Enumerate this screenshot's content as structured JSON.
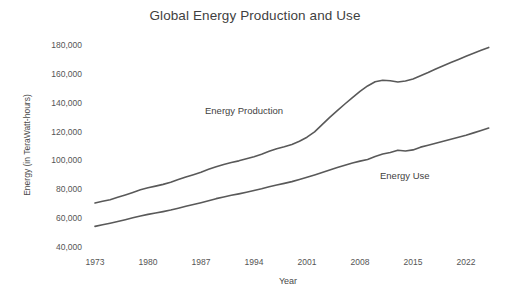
{
  "chart_data": {
    "type": "line",
    "title": "Global Energy Production and Use",
    "xlabel": "Year",
    "ylabel": "Energy (in TeraWatt-hours)",
    "xlim": [
      1973,
      2025
    ],
    "ylim": [
      40000,
      180000
    ],
    "grid": false,
    "legend_position": "inline-labels",
    "y_ticks": [
      40000,
      60000,
      80000,
      100000,
      120000,
      140000,
      160000,
      180000
    ],
    "y_tick_labels": [
      "40,000",
      "60,000",
      "80,000",
      "100,000",
      "120,000",
      "140,000",
      "160,000",
      "180,000"
    ],
    "x_ticks": [
      1973,
      1980,
      1987,
      1994,
      2001,
      2008,
      2015,
      2022
    ],
    "x_tick_labels": [
      "1973",
      "1980",
      "1987",
      "1994",
      "2001",
      "2008",
      "2015",
      "2022"
    ],
    "line_color": "#595959",
    "line_width": 1.6,
    "x": [
      1973,
      1974,
      1975,
      1976,
      1977,
      1978,
      1979,
      1980,
      1981,
      1982,
      1983,
      1984,
      1985,
      1986,
      1987,
      1988,
      1989,
      1990,
      1991,
      1992,
      1993,
      1994,
      1995,
      1996,
      1997,
      1998,
      1999,
      2000,
      2001,
      2002,
      2003,
      2004,
      2005,
      2006,
      2007,
      2008,
      2009,
      2010,
      2011,
      2012,
      2013,
      2014,
      2015,
      2016,
      2017,
      2018,
      2019,
      2020,
      2021,
      2022,
      2023,
      2024,
      2025
    ],
    "series": [
      {
        "name": "Energy Production",
        "label": "Energy Production",
        "color": "#595959",
        "values": [
          71200,
          72400,
          73500,
          75200,
          76800,
          78500,
          80300,
          81700,
          82900,
          84100,
          85600,
          87400,
          89200,
          90800,
          92500,
          94500,
          96300,
          97900,
          99200,
          100400,
          101800,
          103300,
          105000,
          107000,
          108800,
          110200,
          111800,
          114000,
          116800,
          120500,
          125500,
          130500,
          135200,
          139800,
          144200,
          148500,
          152300,
          155200,
          156300,
          155900,
          155000,
          155800,
          157200,
          159400,
          161600,
          164000,
          166300,
          168500,
          170700,
          172900,
          175000,
          177000,
          179000
        ]
      },
      {
        "name": "Energy Use",
        "label": "Energy Use",
        "color": "#595959",
        "values": [
          55000,
          56100,
          57200,
          58400,
          59600,
          60900,
          62200,
          63300,
          64200,
          65200,
          66300,
          67600,
          68900,
          70100,
          71400,
          72800,
          74200,
          75400,
          76500,
          77500,
          78600,
          79800,
          81000,
          82400,
          83700,
          84800,
          86000,
          87500,
          89000,
          90600,
          92300,
          94100,
          95800,
          97400,
          98900,
          100200,
          101300,
          103400,
          105100,
          106200,
          107800,
          107200,
          108000,
          109900,
          111200,
          112600,
          114000,
          115400,
          116800,
          118200,
          119800,
          121500,
          123200
        ]
      }
    ]
  },
  "labels": {
    "production_label": "Energy Production",
    "use_label": "Energy Use"
  }
}
